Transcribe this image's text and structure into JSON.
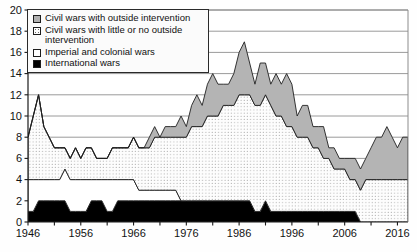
{
  "chart_data": {
    "type": "area",
    "title": "",
    "subtitle": "",
    "xlabel": "",
    "ylabel": "",
    "stacked": true,
    "grid": "horizontal",
    "legend_position": "top-left",
    "xlim": [
      1946,
      2018
    ],
    "ylim": [
      0,
      20
    ],
    "ytick_step": 2,
    "xtick_step": 5,
    "y_ticks": [
      "0",
      "2",
      "4",
      "6",
      "8",
      "10",
      "12",
      "14",
      "16",
      "18",
      "20"
    ],
    "x_ticks": [
      "1946",
      "1956",
      "1966",
      "1976",
      "1986",
      "1996",
      "2006",
      "2016"
    ],
    "x": [
      1946,
      1947,
      1948,
      1949,
      1950,
      1951,
      1952,
      1953,
      1954,
      1955,
      1956,
      1957,
      1958,
      1959,
      1960,
      1961,
      1962,
      1963,
      1964,
      1965,
      1966,
      1967,
      1968,
      1969,
      1970,
      1971,
      1972,
      1973,
      1974,
      1975,
      1976,
      1977,
      1978,
      1979,
      1980,
      1981,
      1982,
      1983,
      1984,
      1985,
      1986,
      1987,
      1988,
      1989,
      1990,
      1991,
      1992,
      1993,
      1994,
      1995,
      1996,
      1997,
      1998,
      1999,
      2000,
      2001,
      2002,
      2003,
      2004,
      2005,
      2006,
      2007,
      2008,
      2009,
      2010,
      2011,
      2012,
      2013,
      2014,
      2015,
      2016,
      2017,
      2018
    ],
    "series": [
      {
        "name": "International wars",
        "key": "international",
        "fill": "#000000",
        "pattern": "solid-black",
        "values": [
          1,
          1,
          2,
          2,
          2,
          2,
          2,
          2,
          1,
          1,
          1,
          1,
          2,
          2,
          2,
          1,
          1,
          2,
          2,
          2,
          2,
          2,
          2,
          2,
          2,
          2,
          2,
          2,
          2,
          2,
          2,
          2,
          2,
          2,
          2,
          2,
          2,
          2,
          2,
          2,
          2,
          2,
          2,
          1,
          1,
          2,
          1,
          1,
          1,
          1,
          1,
          1,
          1,
          1,
          1,
          1,
          1,
          1,
          1,
          1,
          1,
          1,
          1,
          0,
          0,
          0,
          0,
          0,
          0,
          0,
          0,
          0,
          0
        ]
      },
      {
        "name": "Imperial and colonial wars",
        "key": "imperial",
        "fill": "#ffffff",
        "pattern": "white",
        "values": [
          3,
          3,
          2,
          2,
          2,
          2,
          2,
          3,
          3,
          3,
          3,
          3,
          2,
          2,
          2,
          3,
          3,
          2,
          2,
          2,
          2,
          1,
          1,
          1,
          1,
          1,
          1,
          1,
          1,
          0,
          0,
          0,
          0,
          0,
          0,
          0,
          0,
          0,
          0,
          0,
          0,
          0,
          0,
          0,
          0,
          0,
          0,
          0,
          0,
          0,
          0,
          0,
          0,
          0,
          0,
          0,
          0,
          0,
          0,
          0,
          0,
          0,
          0,
          0,
          0,
          0,
          0,
          0,
          0,
          0,
          0,
          0,
          0
        ]
      },
      {
        "name": "Civil wars with little or no outside intervention",
        "key": "civil_no_intervention",
        "fill": "#fdfdfd",
        "pattern": "stipple",
        "values": [
          4,
          6,
          8,
          5,
          4,
          3,
          3,
          2,
          2,
          3,
          2,
          3,
          3,
          2,
          2,
          2,
          3,
          3,
          3,
          3,
          4,
          4,
          4,
          4,
          5,
          5,
          5,
          5,
          5,
          6,
          6,
          7,
          7,
          7,
          8,
          8,
          8,
          9,
          9,
          9,
          10,
          10,
          10,
          10,
          10,
          10,
          10,
          9,
          9,
          8,
          8,
          7,
          7,
          7,
          6,
          6,
          5,
          5,
          4,
          4,
          4,
          3,
          3,
          3,
          4,
          4,
          4,
          4,
          4,
          4,
          4,
          4,
          4
        ]
      },
      {
        "name": "Civil wars with outside intervention",
        "key": "civil_outside_intervention",
        "fill": "#b4b4b4",
        "pattern": "gray",
        "values": [
          0,
          0,
          0,
          0,
          0,
          0,
          0,
          0,
          0,
          0,
          0,
          0,
          0,
          0,
          0,
          0,
          0,
          0,
          0,
          0,
          0,
          0,
          0,
          1,
          1,
          0,
          1,
          1,
          1,
          2,
          1,
          2,
          3,
          2,
          3,
          4,
          3,
          2,
          2,
          3,
          4,
          5,
          3,
          2,
          4,
          3,
          2,
          4,
          3,
          5,
          4,
          2,
          3,
          3,
          2,
          2,
          3,
          1,
          2,
          1,
          1,
          2,
          2,
          2,
          2,
          3,
          4,
          4,
          5,
          4,
          3,
          4,
          4
        ]
      }
    ],
    "totals": [
      8,
      10,
      12,
      9,
      8,
      7,
      7,
      7,
      6,
      7,
      6,
      7,
      7,
      6,
      6,
      6,
      7,
      7,
      7,
      7,
      8,
      7,
      7,
      8,
      9,
      8,
      9,
      9,
      9,
      10,
      9,
      11,
      12,
      11,
      13,
      14,
      13,
      13,
      13,
      14,
      16,
      17,
      15,
      13,
      15,
      15,
      13,
      14,
      13,
      14,
      13,
      10,
      11,
      11,
      9,
      9,
      9,
      7,
      7,
      6,
      6,
      6,
      6,
      5,
      6,
      7,
      8,
      8,
      9,
      8,
      7,
      8,
      8
    ]
  },
  "legend": {
    "items": [
      {
        "label": "Civil wars with outside intervention",
        "swatch": "gray"
      },
      {
        "label": "Civil wars with little or no outside intervention",
        "swatch": "stipple"
      },
      {
        "label": "Imperial and colonial wars",
        "swatch": "white"
      },
      {
        "label": "International wars",
        "swatch": "black"
      }
    ]
  }
}
